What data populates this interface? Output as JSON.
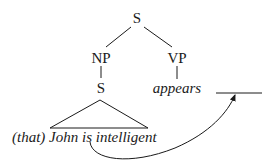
{
  "tree": {
    "root": {
      "label": "S"
    },
    "np": {
      "label": "NP"
    },
    "vp": {
      "label": "VP"
    },
    "embedded_s": {
      "label": "S"
    },
    "verb": {
      "label": "appears"
    },
    "subject_clause": {
      "complementizer": "(that)",
      "text": "John is intelligent"
    },
    "gap": {
      "label": ""
    }
  },
  "movement_arrow": {
    "from": "subject_clause",
    "to": "gap"
  },
  "colors": {
    "ink": "#1a1a1a",
    "background": "#ffffff"
  }
}
